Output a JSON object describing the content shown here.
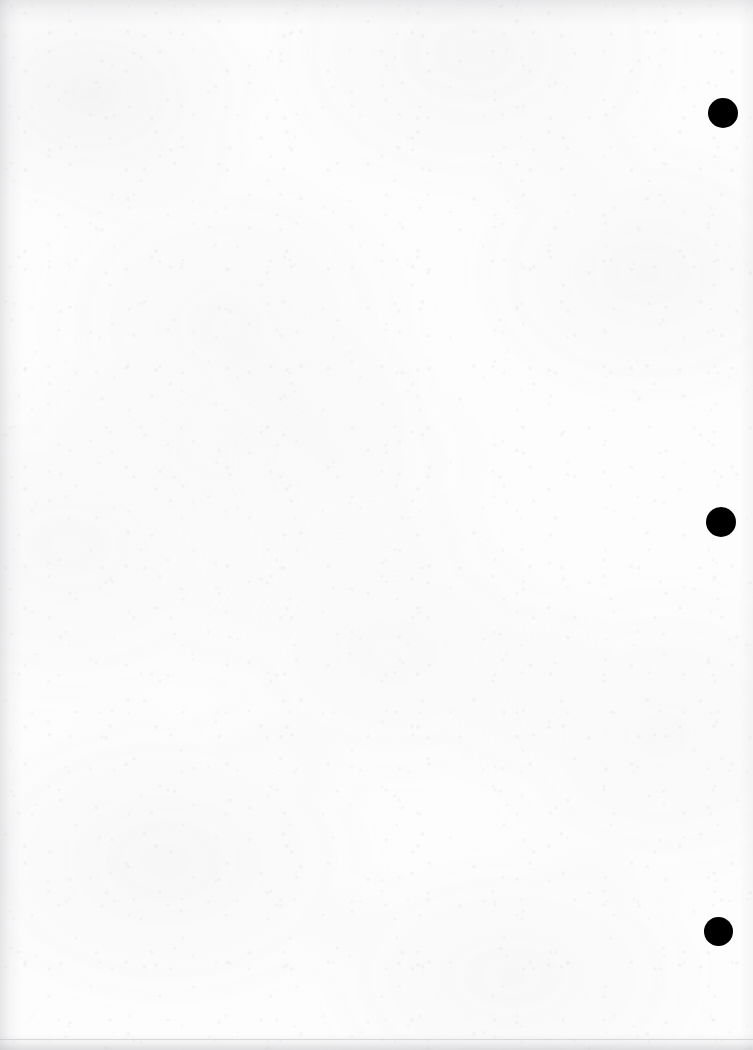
{
  "page": {
    "kind": "scanned-blank-page",
    "width": 753,
    "height": 1050,
    "background_color": "#fdfdfd",
    "paper_tone": "#fcfcfc",
    "text_content": "",
    "note": ""
  },
  "marks": {
    "ink_color": "#000000",
    "dots": [
      {
        "label": "marker-dot-1",
        "center_x": 723,
        "center_y": 113,
        "diameter": 30
      },
      {
        "label": "marker-dot-2",
        "center_x": 721,
        "center_y": 522,
        "diameter": 30
      },
      {
        "label": "marker-dot-3",
        "center_x": 718,
        "center_y": 931,
        "diameter": 29
      }
    ]
  },
  "scan_edges": {
    "top_shadow_color": "#bcbcc1",
    "left_shadow_color": "#babac0",
    "bottom_shadow_color": "#b2b2b8",
    "bottom_rule_y": 1039
  }
}
